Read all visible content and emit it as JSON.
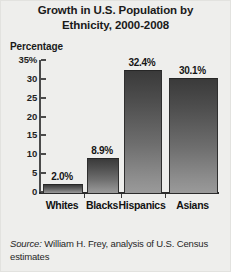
{
  "chart_data": {
    "type": "bar",
    "title": "Growth in U.S. Population by Ethnicity, 2000-2008",
    "title_line1": "Growth in U.S. Population by",
    "title_line2": "Ethnicity, 2000-2008",
    "xlabel": "",
    "ylabel": "Percentage",
    "categories": [
      "Whites",
      "Blacks",
      "Hispanics",
      "Asians"
    ],
    "values": [
      2.0,
      8.9,
      32.4,
      30.1
    ],
    "value_labels": [
      "2.0%",
      "8.9%",
      "32.4%",
      "30.1%"
    ],
    "ylim": [
      0,
      35
    ],
    "ytick_values": [
      0,
      5,
      10,
      15,
      20,
      25,
      30,
      35
    ],
    "ytick_labels": [
      "0",
      "5",
      "10",
      "15",
      "20",
      "25",
      "30",
      "35%"
    ],
    "grid": false,
    "legend": false,
    "bar_color": "#5a5a5a",
    "axis_color": "#2b2b2b",
    "background_color": "#eeeeec"
  },
  "source": {
    "prefix": "Source:",
    "text": " William H. Frey, analysis of U.S. Census estimates"
  }
}
